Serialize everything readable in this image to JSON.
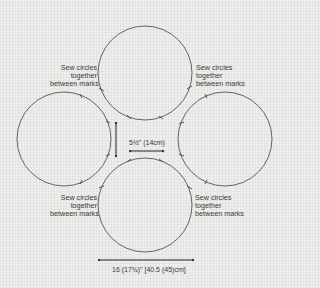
{
  "diagram": {
    "type": "sewing-pattern",
    "colors": {
      "background": "#eeeeec",
      "line": "#555555",
      "text": "#3a3a3a"
    },
    "circles": [
      {
        "id": "top",
        "cx": 145,
        "cy": 73,
        "r": 47
      },
      {
        "id": "left",
        "cx": 64,
        "cy": 139,
        "r": 47
      },
      {
        "id": "right",
        "cx": 225,
        "cy": 139,
        "r": 47
      },
      {
        "id": "bottom",
        "cx": 145,
        "cy": 205,
        "r": 47
      }
    ],
    "labels": {
      "top_left": [
        "Sew circles",
        "together",
        "between marks"
      ],
      "top_right": [
        "Sew circles",
        "together",
        "between marks"
      ],
      "bottom_left": [
        "Sew circles",
        "together",
        "between marks"
      ],
      "bottom_right": [
        "Sew circles",
        "together",
        "between marks"
      ]
    },
    "dimensions": {
      "gap": "5½\" (14cm)",
      "overall_width": "16 (17¾)\" [40.5 (45)cm]"
    }
  }
}
